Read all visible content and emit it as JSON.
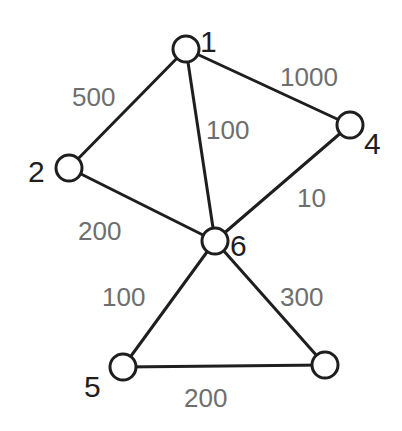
{
  "graph": {
    "nodes": [
      {
        "id": "n1",
        "label": "1"
      },
      {
        "id": "n2",
        "label": "2"
      },
      {
        "id": "n4",
        "label": "4"
      },
      {
        "id": "n6",
        "label": "6"
      },
      {
        "id": "n5",
        "label": "5"
      },
      {
        "id": "n7",
        "label": ""
      }
    ],
    "edges": [
      {
        "from": "n1",
        "to": "n2",
        "weight": "500"
      },
      {
        "from": "n1",
        "to": "n6",
        "weight": "100"
      },
      {
        "from": "n1",
        "to": "n4",
        "weight": "1000"
      },
      {
        "from": "n4",
        "to": "n6",
        "weight": "10"
      },
      {
        "from": "n2",
        "to": "n6",
        "weight": "200"
      },
      {
        "from": "n6",
        "to": "n5",
        "weight": "100"
      },
      {
        "from": "n6",
        "to": "n7",
        "weight": "300"
      },
      {
        "from": "n5",
        "to": "n7",
        "weight": "200"
      }
    ],
    "colors": {
      "line": "#1e1e1e",
      "weight_text": "#6e6e6e"
    }
  }
}
